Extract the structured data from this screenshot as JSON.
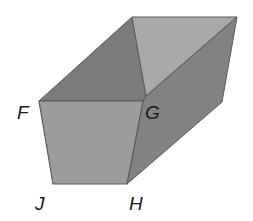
{
  "figure": {
    "type": "prism-diagram",
    "labels": {
      "F": "F",
      "G": "G",
      "H": "H",
      "J": "J"
    },
    "colors": {
      "front_face": "#9c9c9c",
      "inner_left_face": "#7b7b7b",
      "inner_top_face": "#a9a9a9",
      "right_face": "#828282",
      "edge": "#5a5a5a",
      "label": "#1a1a1a"
    }
  }
}
